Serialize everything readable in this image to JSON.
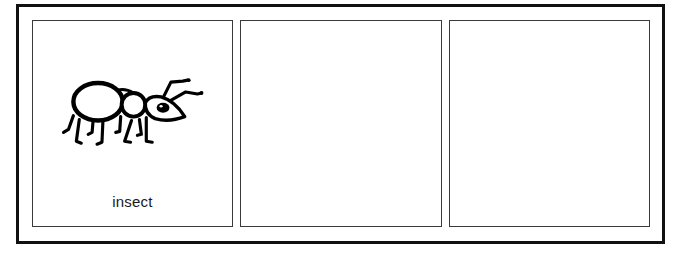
{
  "worksheet": {
    "panel_count": 3,
    "border_color": "#111111",
    "panel_border_color": "#3a3a3a",
    "panels": [
      {
        "index": 1,
        "icon": "ant-icon",
        "label": "insect"
      },
      {
        "index": 2,
        "icon": "",
        "label": ""
      },
      {
        "index": 3,
        "icon": "",
        "label": ""
      }
    ]
  }
}
